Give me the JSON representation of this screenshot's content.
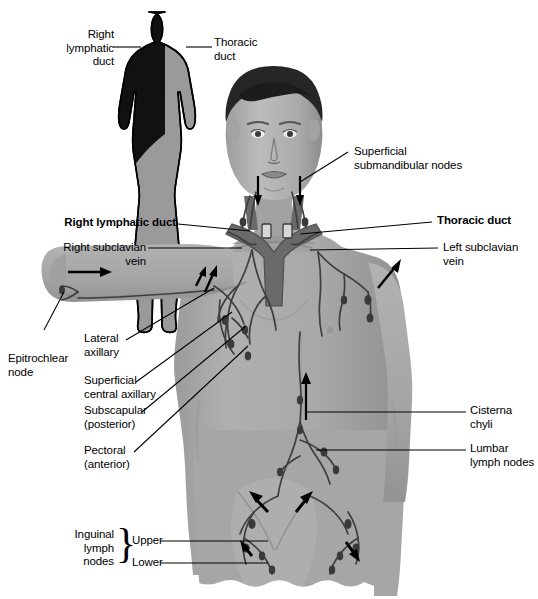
{
  "figure": {
    "background_color": "#ffffff",
    "ink_color": "#000000",
    "skin_tone": "#a9a9a9",
    "vessel_color": "#4a4a4a",
    "duct_color": "#6f6f6f",
    "inset_dark_color": "#111111",
    "inset_light_color": "#9a9a9a"
  },
  "inset": {
    "name": "drainage-territory-silhouette",
    "labels": {
      "right_lymphatic_duct": "Right\nlymphatic\nduct",
      "thoracic_duct": "Thoracic\nduct"
    }
  },
  "labels": {
    "superficial_submandibular_nodes": "Superficial\nsubmandibular nodes",
    "right_lymphatic_duct": "Right lymphatic duct",
    "thoracic_duct": "Thoracic duct",
    "right_subclavian_vein": "Right subclavian\nvein",
    "left_subclavian_vein": "Left subclavian\nvein",
    "epitrochlear_node": "Epitrochlear\nnode",
    "lateral_axillary": "Lateral\naxillary",
    "superficial_central_axillary": "Superficial\ncentral axillary",
    "subscapular_posterior": "Subscapular\n(posterior)",
    "pectoral_anterior": "Pectoral\n(anterior)",
    "cisterna_chyli": "Cisterna\nchyli",
    "lumbar_lymph_nodes": "Lumbar\nlymph nodes",
    "inguinal_lymph_nodes": "Inguinal\nlymph\nnodes",
    "inguinal_upper": "Upper",
    "inguinal_lower": "Lower"
  }
}
